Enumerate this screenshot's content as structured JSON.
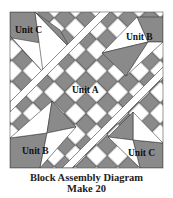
{
  "diagram": {
    "colors": {
      "dark": "#8a8a8a",
      "light": "#ffffff",
      "stroke": "#3a3a3a"
    },
    "labels": {
      "unit_c_top_left": "Unit C",
      "unit_b_top_right": "Unit B",
      "unit_a_center": "Unit A",
      "unit_b_bottom_left": "Unit B",
      "unit_c_bottom_right": "Unit C"
    }
  },
  "caption": {
    "title": "Block Assembly Diagram",
    "subtitle": "Make 20"
  }
}
